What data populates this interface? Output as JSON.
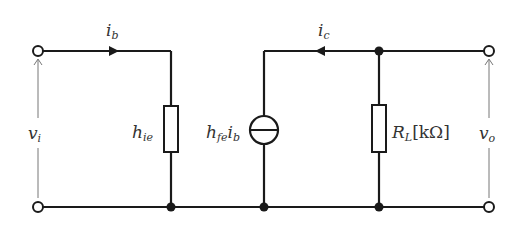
{
  "diagram": {
    "type": "small-signal equivalent circuit (h-parameter, common emitter)",
    "labels": {
      "input_current": {
        "main": "i",
        "sub": "b"
      },
      "output_current": {
        "main": "i",
        "sub": "c"
      },
      "input_voltage": {
        "main": "v",
        "sub": "i"
      },
      "output_voltage": {
        "main": "v",
        "sub": "o"
      },
      "input_resistance": {
        "main": "h",
        "sub": "ie"
      },
      "current_source": {
        "main": "h",
        "sub": "fe",
        "tail_main": "i",
        "tail_sub": "b"
      },
      "load_resistor": {
        "main": "R",
        "sub": "L",
        "unit": "[kΩ]"
      }
    },
    "components": [
      {
        "id": "input-terminal-top",
        "kind": "open-terminal"
      },
      {
        "id": "input-terminal-bottom",
        "kind": "open-terminal"
      },
      {
        "id": "h-ie",
        "kind": "resistor"
      },
      {
        "id": "current-source",
        "kind": "dependent-current-source",
        "value": "hfe·ib"
      },
      {
        "id": "R-L",
        "kind": "resistor",
        "unit": "kΩ"
      },
      {
        "id": "output-terminal-top",
        "kind": "open-terminal"
      },
      {
        "id": "output-terminal-bottom",
        "kind": "open-terminal"
      }
    ],
    "colors": {
      "wire": "#1a1a1a",
      "label": "#333333",
      "voltage_arrow": "#777777"
    }
  }
}
